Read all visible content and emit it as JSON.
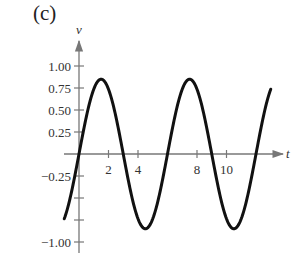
{
  "panel": {
    "label": "(c)"
  },
  "chart_data": {
    "type": "line",
    "title": "",
    "xlabel": "t",
    "ylabel": "v",
    "xlim": [
      -1,
      13
    ],
    "ylim": [
      -1.05,
      1.2
    ],
    "grid": false,
    "legend": null,
    "x_ticks": [
      2,
      4,
      8,
      10
    ],
    "x_tick_labels": [
      "2",
      "4",
      "8",
      "10"
    ],
    "y_ticks": [
      1.0,
      0.75,
      0.5,
      0.25,
      -0.25,
      -0.5,
      -0.75,
      -1.0
    ],
    "y_tick_labels": [
      "1.00",
      "0.75",
      "0.50",
      "0.25",
      "−0.25",
      "",
      "",
      "−1.00"
    ],
    "series": [
      {
        "name": "v(t)",
        "description": "sinusoid, amplitude ~0.85, period ~6",
        "x": [
          -1,
          -0.5,
          0,
          0.5,
          1,
          1.5,
          2,
          2.5,
          3,
          3.5,
          4,
          4.5,
          5,
          5.5,
          6,
          6.5,
          7,
          7.5,
          8,
          8.5,
          9,
          9.5,
          10,
          10.5,
          11,
          11.5,
          12,
          12.5,
          13
        ],
        "values": [
          -0.74,
          -0.43,
          0.0,
          0.43,
          0.74,
          0.85,
          0.74,
          0.43,
          0.0,
          -0.43,
          -0.74,
          -0.85,
          -0.74,
          -0.43,
          0.0,
          0.43,
          0.74,
          0.85,
          0.74,
          0.43,
          0.0,
          -0.43,
          -0.74,
          -0.85,
          -0.74,
          -0.43,
          0.0,
          0.43,
          0.74
        ],
        "color": "#111111"
      }
    ],
    "axis_color": "#777777"
  }
}
